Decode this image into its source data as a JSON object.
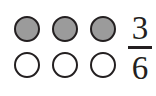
{
  "figure": {
    "background_color": "#ffffff"
  },
  "grid": {
    "rows": 2,
    "columns": 3,
    "shape": "circle",
    "outline_color": "#231f20",
    "filled_color": "#9b9b9b",
    "empty_color": "#ffffff",
    "cells": [
      {
        "row": 0,
        "column": 0,
        "state": "filled"
      },
      {
        "row": 0,
        "column": 1,
        "state": "filled"
      },
      {
        "row": 0,
        "column": 2,
        "state": "filled"
      },
      {
        "row": 1,
        "column": 0,
        "state": "empty"
      },
      {
        "row": 1,
        "column": 1,
        "state": "empty"
      },
      {
        "row": 1,
        "column": 2,
        "state": "empty"
      }
    ]
  },
  "fraction": {
    "numerator": "3",
    "denominator": "6",
    "bar_color": "#231f20",
    "text_color": "#231f20"
  },
  "chart_data": {
    "type": "pie",
    "title": "",
    "categories": [
      "Shaded",
      "Unshaded"
    ],
    "values": [
      3,
      3
    ],
    "total": 6,
    "xlabel": "",
    "ylabel": "",
    "annotations": [
      "3/6"
    ]
  }
}
